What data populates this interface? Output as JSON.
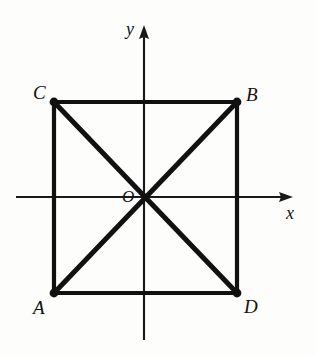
{
  "figure": {
    "kind": "geometry-diagram",
    "background_color": "#fdfdfc",
    "ink_color": "#111111"
  },
  "axes": {
    "x_axis": {
      "label": "x",
      "label_position": {
        "x": 286,
        "y": 204
      },
      "start": {
        "x": 16,
        "y": 197
      },
      "end": {
        "x": 293,
        "y": 197
      },
      "has_arrow": true,
      "arrow_at": "end"
    },
    "y_axis": {
      "label": "y",
      "label_position": {
        "x": 126,
        "y": 20
      },
      "start": {
        "x": 144,
        "y": 340
      },
      "end": {
        "x": 144,
        "y": 25
      },
      "has_arrow": true,
      "arrow_at": "end"
    },
    "origin": {
      "label": "O",
      "x": 145,
      "y": 197,
      "label_position": {
        "x": 122,
        "y": 188
      }
    }
  },
  "square": {
    "name": "ABCD",
    "left": 54,
    "right": 237,
    "top": 102,
    "bottom": 293,
    "width": 183,
    "height": 191,
    "vertices": [
      {
        "label": "C",
        "x": 54,
        "y": 102,
        "label_position": {
          "x": 33,
          "y": 83
        }
      },
      {
        "label": "B",
        "x": 237,
        "y": 102,
        "label_position": {
          "x": 246,
          "y": 85
        }
      },
      {
        "label": "D",
        "x": 237,
        "y": 293,
        "label_position": {
          "x": 244,
          "y": 297
        }
      },
      {
        "label": "A",
        "x": 54,
        "y": 293,
        "label_position": {
          "x": 33,
          "y": 298
        }
      }
    ],
    "edges": [
      {
        "name": "edge-CB",
        "from": "C",
        "to": "B"
      },
      {
        "name": "edge-BD",
        "from": "B",
        "to": "D"
      },
      {
        "name": "edge-DA",
        "from": "D",
        "to": "A"
      },
      {
        "name": "edge-AC",
        "from": "A",
        "to": "C"
      }
    ],
    "diagonals": [
      {
        "name": "diagonal-AB",
        "from": "A",
        "to": "B"
      },
      {
        "name": "diagonal-CD",
        "from": "C",
        "to": "D"
      }
    ],
    "vertex_dot_radius": 4.2
  }
}
